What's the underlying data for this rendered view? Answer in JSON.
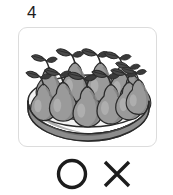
{
  "question": {
    "number": "4",
    "number_name": "question-number"
  },
  "image_card": {
    "alt": "plate of pears",
    "illustration_name": "pears-on-plate-illustration",
    "border_color": "#dcdcdc",
    "background_color": "#ffffff",
    "subject": "pears",
    "container": "plate",
    "pear_count": 11,
    "style": "grayscale line drawing"
  },
  "illustration_colors": {
    "outline": "#2b2b2b",
    "pear_body": "#9a9a9a",
    "pear_body_dark": "#868686",
    "pear_highlight": "#b4b4b4",
    "leaf": "#4a4a4a",
    "leaf_dark": "#3a3a3a",
    "plate_top": "#f2f2f2",
    "plate_inner": "#e4e4e4",
    "plate_rim": "#cfcfcf",
    "plate_side": "#8d8d8d",
    "plate_shadow": "#6f6f6f"
  },
  "answers": {
    "options": [
      {
        "id": "circle",
        "label": "O",
        "name": "answer-choice-circle",
        "meaning": "correct"
      },
      {
        "id": "cross",
        "label": "X",
        "name": "answer-choice-cross",
        "meaning": "incorrect"
      }
    ],
    "stroke_color": "#1c1c1c"
  }
}
